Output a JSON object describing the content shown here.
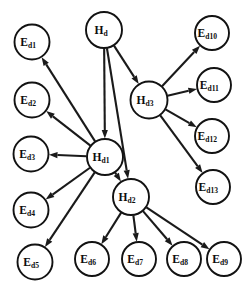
{
  "diagram": {
    "type": "directed-graph",
    "colors": {
      "background": "#ffffff",
      "node_fill": "#ffffff",
      "node_stroke": "#121212",
      "edge_stroke": "#1a1a1a",
      "label_color": "#0d0d0d"
    },
    "nodes": [
      {
        "id": "Hd",
        "base": "H",
        "sub": "d",
        "label": "Hd",
        "kind": "hypothesis",
        "cx": 104,
        "cy": 30,
        "r": 18
      },
      {
        "id": "Hd1",
        "base": "H",
        "sub": "d1",
        "label": "Hd1",
        "kind": "hypothesis",
        "cx": 105,
        "cy": 157,
        "r": 18
      },
      {
        "id": "Hd2",
        "base": "H",
        "sub": "d2",
        "label": "Hd2",
        "kind": "hypothesis",
        "cx": 131,
        "cy": 197,
        "r": 18
      },
      {
        "id": "Hd3",
        "base": "H",
        "sub": "d3",
        "label": "Hd3",
        "kind": "hypothesis",
        "cx": 149,
        "cy": 100,
        "r": 18.5
      },
      {
        "id": "Ed1",
        "base": "E",
        "sub": "d1",
        "label": "Ed1",
        "kind": "evidence",
        "cx": 32,
        "cy": 42,
        "r": 17.5
      },
      {
        "id": "Ed2",
        "base": "E",
        "sub": "d2",
        "label": "Ed2",
        "kind": "evidence",
        "cx": 32,
        "cy": 100,
        "r": 17.5
      },
      {
        "id": "Ed3",
        "base": "E",
        "sub": "d3",
        "label": "Ed3",
        "kind": "evidence",
        "cx": 31,
        "cy": 154,
        "r": 17.5
      },
      {
        "id": "Ed4",
        "base": "E",
        "sub": "d4",
        "label": "Ed4",
        "kind": "evidence",
        "cx": 31,
        "cy": 210,
        "r": 17.5
      },
      {
        "id": "Ed5",
        "base": "E",
        "sub": "d5",
        "label": "Ed5",
        "kind": "evidence",
        "cx": 35,
        "cy": 262,
        "r": 17.5
      },
      {
        "id": "Ed6",
        "base": "E",
        "sub": "d6",
        "label": "Ed6",
        "kind": "evidence",
        "cx": 92,
        "cy": 259,
        "r": 17
      },
      {
        "id": "Ed7",
        "base": "E",
        "sub": "d7",
        "label": "Ed7",
        "kind": "evidence",
        "cx": 139,
        "cy": 259,
        "r": 17
      },
      {
        "id": "Ed8",
        "base": "E",
        "sub": "d8",
        "label": "Ed8",
        "kind": "evidence",
        "cx": 184,
        "cy": 259,
        "r": 17
      },
      {
        "id": "Ed9",
        "base": "E",
        "sub": "d9",
        "label": "Ed9",
        "kind": "evidence",
        "cx": 224,
        "cy": 259,
        "r": 17
      },
      {
        "id": "Ed10",
        "base": "E",
        "sub": "d10",
        "label": "Ed10",
        "kind": "evidence",
        "cx": 212,
        "cy": 33,
        "r": 17
      },
      {
        "id": "Ed11",
        "base": "E",
        "sub": "d11",
        "label": "Ed11",
        "kind": "evidence",
        "cx": 214,
        "cy": 85,
        "r": 17
      },
      {
        "id": "Ed12",
        "base": "E",
        "sub": "d12",
        "label": "Ed12",
        "kind": "evidence",
        "cx": 212,
        "cy": 136,
        "r": 17
      },
      {
        "id": "Ed13",
        "base": "E",
        "sub": "d13",
        "label": "Ed13",
        "kind": "evidence",
        "cx": 213,
        "cy": 187,
        "r": 17
      }
    ],
    "edges": [
      {
        "from": "Hd",
        "to": "Hd1",
        "directed": true
      },
      {
        "from": "Hd",
        "to": "Hd2",
        "directed": true
      },
      {
        "from": "Hd",
        "to": "Hd3",
        "directed": true
      },
      {
        "from": "Hd1",
        "to": "Ed1",
        "directed": true
      },
      {
        "from": "Hd1",
        "to": "Ed2",
        "directed": true
      },
      {
        "from": "Hd1",
        "to": "Ed3",
        "directed": true
      },
      {
        "from": "Hd1",
        "to": "Ed4",
        "directed": true
      },
      {
        "from": "Hd1",
        "to": "Ed5",
        "directed": true
      },
      {
        "from": "Hd1",
        "to": "Hd2",
        "directed": true
      },
      {
        "from": "Hd2",
        "to": "Ed6",
        "directed": true
      },
      {
        "from": "Hd2",
        "to": "Ed7",
        "directed": true
      },
      {
        "from": "Hd2",
        "to": "Ed8",
        "directed": true
      },
      {
        "from": "Hd2",
        "to": "Ed9",
        "directed": true
      },
      {
        "from": "Hd3",
        "to": "Ed10",
        "directed": true
      },
      {
        "from": "Hd3",
        "to": "Ed11",
        "directed": true
      },
      {
        "from": "Hd3",
        "to": "Ed12",
        "directed": true
      },
      {
        "from": "Hd3",
        "to": "Ed13",
        "directed": true
      }
    ]
  }
}
